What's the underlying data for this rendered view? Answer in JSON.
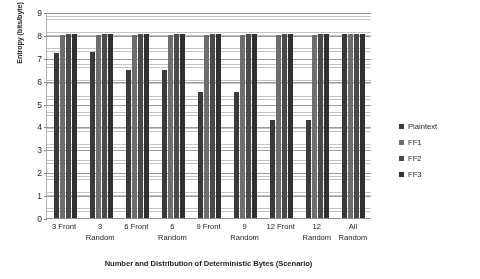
{
  "chart_data": {
    "type": "bar",
    "title": "",
    "xlabel": "Number and Distribution of Deterministic Bytes (Scenario)",
    "ylabel": "Entropy (bits/byte)",
    "ylim": [
      0,
      9
    ],
    "ytick_labels": [
      "9",
      "8",
      "7",
      "6",
      "5",
      "4",
      "3",
      "2",
      "1",
      "0"
    ],
    "ytick_values": [
      9,
      8,
      7,
      6,
      5,
      4,
      3,
      2,
      1,
      0
    ],
    "grid": "horizontal",
    "legend_position": "right",
    "categories": [
      "3 Front",
      "3 Random",
      "6 Front",
      "6 Random",
      "9 Front",
      "9 Random",
      "12 Front",
      "12 Random",
      "All Random"
    ],
    "category_lines": [
      [
        "3 Front"
      ],
      [
        "3",
        "Random"
      ],
      [
        "6 Front"
      ],
      [
        "6",
        "Random"
      ],
      [
        "9 Front"
      ],
      [
        "9",
        "Random"
      ],
      [
        "12 Front"
      ],
      [
        "12",
        "Random"
      ],
      [
        "All",
        "Random"
      ]
    ],
    "series": [
      {
        "name": "Plaintext",
        "color": "#3a3a3a",
        "values": [
          7.2,
          7.25,
          6.45,
          6.45,
          5.5,
          5.5,
          4.3,
          4.3,
          8.05
        ]
      },
      {
        "name": "FF1",
        "color": "#6e6e6e",
        "values": [
          8.0,
          8.0,
          8.0,
          8.0,
          8.0,
          8.0,
          8.0,
          8.0,
          8.05
        ]
      },
      {
        "name": "FF2",
        "color": "#4a4a4a",
        "values": [
          8.05,
          8.05,
          8.05,
          8.05,
          8.05,
          8.05,
          8.05,
          8.05,
          8.05
        ]
      },
      {
        "name": "FF3",
        "color": "#303030",
        "values": [
          8.05,
          8.05,
          8.05,
          8.05,
          8.05,
          8.05,
          8.05,
          8.05,
          8.05
        ]
      }
    ]
  }
}
